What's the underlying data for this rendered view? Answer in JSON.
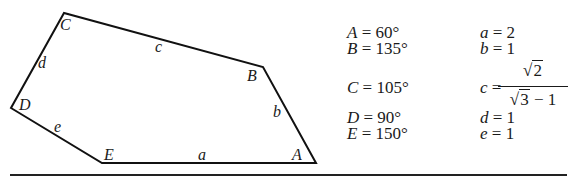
{
  "figure": {
    "vertices": {
      "A": {
        "label": "A",
        "x": 316,
        "y": 163,
        "lx": 292,
        "ly": 147
      },
      "B": {
        "label": "B",
        "x": 263,
        "y": 67,
        "lx": 247,
        "ly": 68
      },
      "C": {
        "label": "C",
        "x": 64,
        "y": 13,
        "lx": 60,
        "ly": 17
      },
      "D": {
        "label": "D",
        "x": 11,
        "y": 108,
        "lx": 19,
        "ly": 97
      },
      "E": {
        "label": "E",
        "x": 102,
        "y": 163,
        "lx": 104,
        "ly": 147
      }
    },
    "sides": {
      "a": {
        "label": "a",
        "lx": 198,
        "ly": 147
      },
      "b": {
        "label": "b",
        "lx": 273,
        "ly": 104
      },
      "c": {
        "label": "c",
        "lx": 155,
        "ly": 39
      },
      "d": {
        "label": "d",
        "lx": 38,
        "ly": 55
      },
      "e": {
        "label": "e",
        "lx": 54,
        "ly": 119
      }
    },
    "stroke_color": "#111111"
  },
  "angles": [
    {
      "var": "A",
      "eq": " = 60°"
    },
    {
      "var": "B",
      "eq": " = 135°"
    },
    {
      "var": "C",
      "eq": " = 105°"
    },
    {
      "var": "D",
      "eq": " = 90°"
    },
    {
      "var": "E",
      "eq": " = 150°"
    }
  ],
  "lengths": [
    {
      "var": "a",
      "eq": " = 2"
    },
    {
      "var": "b",
      "eq": " = 1"
    },
    {
      "var": "c",
      "eq": " = ",
      "num_radicand": "2",
      "den_radicand": "3",
      "den_rest": " − 1"
    },
    {
      "var": "d",
      "eq": " = 1"
    },
    {
      "var": "e",
      "eq": " = 1"
    }
  ]
}
